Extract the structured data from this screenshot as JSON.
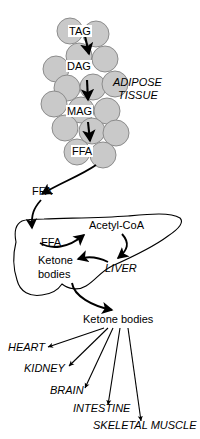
{
  "figure": {
    "colors": {
      "cell_fill": "#c9c9c9",
      "cell_stroke": "#8c8c8c",
      "line": "#000000",
      "background": "#ffffff"
    }
  },
  "adipose": {
    "tissue_label": "ADIPOSE",
    "tissue_label2": "TISSUE",
    "steps": [
      {
        "id": "tag",
        "label": "TAG"
      },
      {
        "id": "dag",
        "label": "DAG"
      },
      {
        "id": "mag",
        "label": "MAG"
      },
      {
        "id": "ffa",
        "label": "FFA"
      }
    ],
    "cells": [
      {
        "cx": 70,
        "cy": 31,
        "r": 13
      },
      {
        "cx": 96,
        "cy": 34,
        "r": 13
      },
      {
        "cx": 79,
        "cy": 56,
        "r": 13
      },
      {
        "cx": 105,
        "cy": 59,
        "r": 13
      },
      {
        "cx": 56,
        "cy": 69,
        "r": 13
      },
      {
        "cx": 67,
        "cy": 88,
        "r": 13
      },
      {
        "cx": 93,
        "cy": 87,
        "r": 13
      },
      {
        "cx": 115,
        "cy": 84,
        "r": 13
      },
      {
        "cx": 54,
        "cy": 104,
        "r": 13
      },
      {
        "cx": 81,
        "cy": 110,
        "r": 13
      },
      {
        "cx": 107,
        "cy": 111,
        "r": 13
      },
      {
        "cx": 65,
        "cy": 128,
        "r": 13
      },
      {
        "cx": 92,
        "cy": 131,
        "r": 13
      },
      {
        "cx": 116,
        "cy": 133,
        "r": 13
      },
      {
        "cx": 77,
        "cy": 152,
        "r": 13
      },
      {
        "cx": 103,
        "cy": 155,
        "r": 13
      }
    ]
  },
  "circulation": {
    "ffa_released_label": "FFA"
  },
  "liver": {
    "organ_label": "LIVER",
    "ffa_label": "FFA",
    "acetyl_coa_label": "Acetyl-CoA",
    "ketone_label_line1": "Ketone",
    "ketone_label_line2": "bodies"
  },
  "output": {
    "ketone_bodies_label": "Ketone bodies",
    "target_tissues": [
      {
        "id": "heart",
        "label": "HEART"
      },
      {
        "id": "kidney",
        "label": "KIDNEY"
      },
      {
        "id": "brain",
        "label": "BRAIN"
      },
      {
        "id": "intestine",
        "label": "INTESTINE"
      },
      {
        "id": "skeletal-muscle",
        "label": "SKELETAL MUSCLE"
      }
    ]
  }
}
